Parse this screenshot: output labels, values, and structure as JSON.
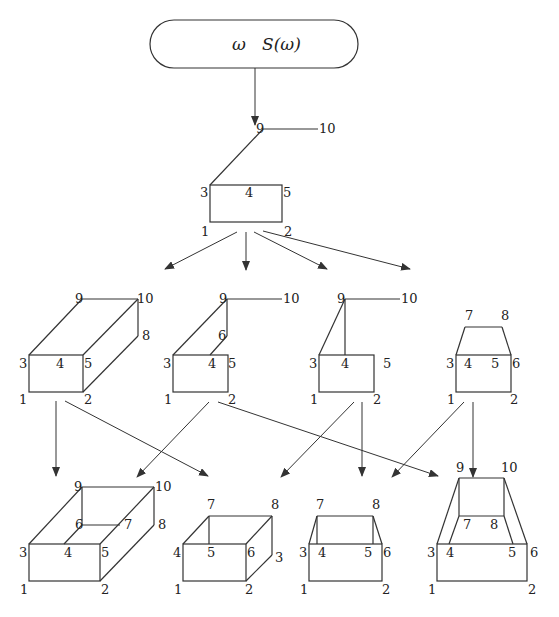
{
  "root": {
    "label_omega": "ω",
    "label_S": "S(ω)"
  },
  "seed": {
    "labels": {
      "n1": "1",
      "n2": "2",
      "n3": "3",
      "n4": "4",
      "n5": "5",
      "n9": "9",
      "n10": "10"
    }
  },
  "level1": [
    {
      "id": "a",
      "labels": {
        "n1": "1",
        "n2": "2",
        "n3": "3",
        "n4": "4",
        "n5": "5",
        "n8": "8",
        "n9": "9",
        "n10": "10"
      }
    },
    {
      "id": "b",
      "labels": {
        "n1": "1",
        "n2": "2",
        "n3": "3",
        "n4": "4",
        "n5": "5",
        "n6": "6",
        "n9": "9",
        "n10": "10"
      }
    },
    {
      "id": "c",
      "labels": {
        "n1": "1",
        "n2": "2",
        "n3": "3",
        "n4": "4",
        "n5": "5",
        "n9": "9",
        "n10": "10"
      }
    },
    {
      "id": "d",
      "labels": {
        "n1": "1",
        "n2": "2",
        "n3": "3",
        "n4": "4",
        "n5": "5",
        "n6": "6",
        "n7": "7",
        "n8": "8"
      }
    }
  ],
  "level2": [
    {
      "id": "e",
      "labels": {
        "n1": "1",
        "n2": "2",
        "n3": "3",
        "n4": "4",
        "n5": "5",
        "n6": "6",
        "n7": "7",
        "n8": "8",
        "n9": "9",
        "n10": "10"
      }
    },
    {
      "id": "f",
      "labels": {
        "n1": "1",
        "n2": "2",
        "n3": "3",
        "n4": "4",
        "n5": "5",
        "n6": "6",
        "n7": "7",
        "n8": "8"
      }
    },
    {
      "id": "g",
      "labels": {
        "n1": "1",
        "n2": "2",
        "n3": "3",
        "n4": "4",
        "n5": "5",
        "n6": "6",
        "n7": "7",
        "n8": "8"
      }
    },
    {
      "id": "h",
      "labels": {
        "n1": "1",
        "n2": "2",
        "n3": "3",
        "n4": "4",
        "n5": "5",
        "n6": "6",
        "n7": "7",
        "n8": "8",
        "n9": "9",
        "n10": "10"
      }
    }
  ]
}
